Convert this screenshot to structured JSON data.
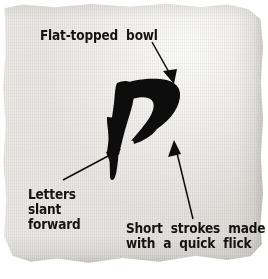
{
  "figure": {
    "kind": "annotated-calligraphy-sample",
    "medium": "torn handmade paper swatch with brush-drawn letter",
    "glyph": {
      "name": "calligraphic-letter-p",
      "description": "flat-topped bowl with forward slanting descending stem"
    },
    "colors": {
      "paper": "#eceae6",
      "paper_shadow": "#696661",
      "ink": "#101010",
      "text": "#141414",
      "page_background": "#ffffff"
    }
  },
  "annotations": [
    {
      "id": "flat-topped-bowl",
      "text": "Flat-topped  bowl",
      "points_to": "top of the bowl",
      "arrow": {
        "from": [
          152,
          42
        ],
        "to": [
          173,
          83
        ]
      }
    },
    {
      "id": "letters-slant-forward",
      "text": "Letters\nslant\nforward",
      "points_to": "slanting stem",
      "arrow": {
        "from": [
          63,
          180
        ],
        "to": [
          120,
          149
        ]
      }
    },
    {
      "id": "short-strokes",
      "text": "Short  strokes  made\nwith  a  quick  flick",
      "points_to": "short flicked stroke",
      "arrow": {
        "from": [
          193,
          219
        ],
        "to": [
          174,
          141
        ]
      }
    }
  ]
}
